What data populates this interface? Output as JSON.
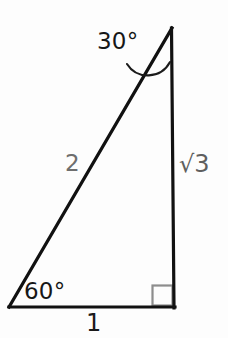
{
  "figure": {
    "background_color": "#fdfdfd",
    "stroke_color": "#111111",
    "stroke_width": 3,
    "width": 228,
    "height": 338,
    "labels": {
      "angle_top": "30°",
      "angle_bottom_left": "60°",
      "side_hypotenuse": "2",
      "side_vertical": "√3",
      "side_base": "1"
    },
    "label_colors": {
      "angle_top": "#171717",
      "angle_bottom_left": "#171717",
      "side_hypotenuse": "#6e6e6e",
      "side_vertical": "#5f5f5f",
      "side_base": "#1a1a1a",
      "right_angle_marker": "#8a8a8a"
    },
    "geometry": {
      "apex": [
        172,
        28
      ],
      "bottom_left": [
        9,
        307
      ],
      "bottom_right": [
        174,
        307
      ],
      "right_angle_marker_size": 20,
      "angle_arc_label": "30° arc at apex"
    }
  }
}
